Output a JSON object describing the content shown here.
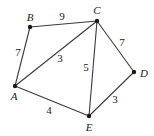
{
  "graph": {
    "type": "weighted-undirected-graph",
    "nodes": [
      {
        "id": "A",
        "label": "A",
        "x": 15,
        "y": 86,
        "lx": 14,
        "ly": 100
      },
      {
        "id": "B",
        "label": "B",
        "x": 30,
        "y": 27,
        "lx": 30,
        "ly": 21
      },
      {
        "id": "C",
        "label": "C",
        "x": 97,
        "y": 21,
        "lx": 97,
        "ly": 14
      },
      {
        "id": "D",
        "label": "D",
        "x": 134,
        "y": 72,
        "lx": 144,
        "ly": 77
      },
      {
        "id": "E",
        "label": "E",
        "x": 89,
        "y": 116,
        "lx": 89,
        "ly": 131
      }
    ],
    "edges": [
      {
        "from": "B",
        "to": "C",
        "weight": "9",
        "wx": 62,
        "wy": 20
      },
      {
        "from": "A",
        "to": "B",
        "weight": "7",
        "wx": 18,
        "wy": 56
      },
      {
        "from": "A",
        "to": "C",
        "weight": "3",
        "wx": 60,
        "wy": 62
      },
      {
        "from": "C",
        "to": "E",
        "weight": "5",
        "wx": 86,
        "wy": 71
      },
      {
        "from": "C",
        "to": "D",
        "weight": "7",
        "wx": 122,
        "wy": 46
      },
      {
        "from": "A",
        "to": "E",
        "weight": "4",
        "wx": 49,
        "wy": 114
      },
      {
        "from": "D",
        "to": "E",
        "weight": "3",
        "wx": 115,
        "wy": 103
      }
    ]
  }
}
